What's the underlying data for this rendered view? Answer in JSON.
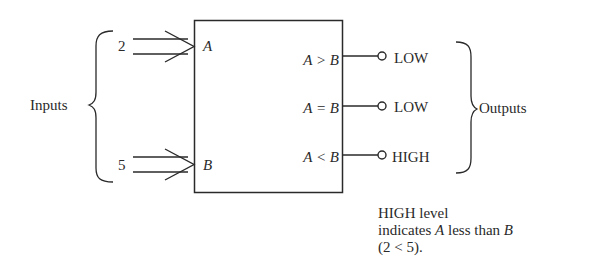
{
  "diagram": {
    "inputs_label": "Inputs",
    "outputs_label": "Outputs",
    "inputs": [
      {
        "name": "A",
        "value": "2"
      },
      {
        "name": "B",
        "value": "5"
      }
    ],
    "outputs": [
      {
        "name": "A > B",
        "level": "LOW"
      },
      {
        "name": "A = B",
        "level": "LOW"
      },
      {
        "name": "A < B",
        "level": "HIGH"
      }
    ],
    "note": {
      "line1": "HIGH level",
      "line2_prefix": "indicates ",
      "line2_var_a": "A",
      "line2_mid": " less than ",
      "line2_var_b": "B",
      "line3": "(2 < 5)."
    },
    "colors": {
      "stroke": "#2a2a2a",
      "background": "#ffffff"
    }
  }
}
